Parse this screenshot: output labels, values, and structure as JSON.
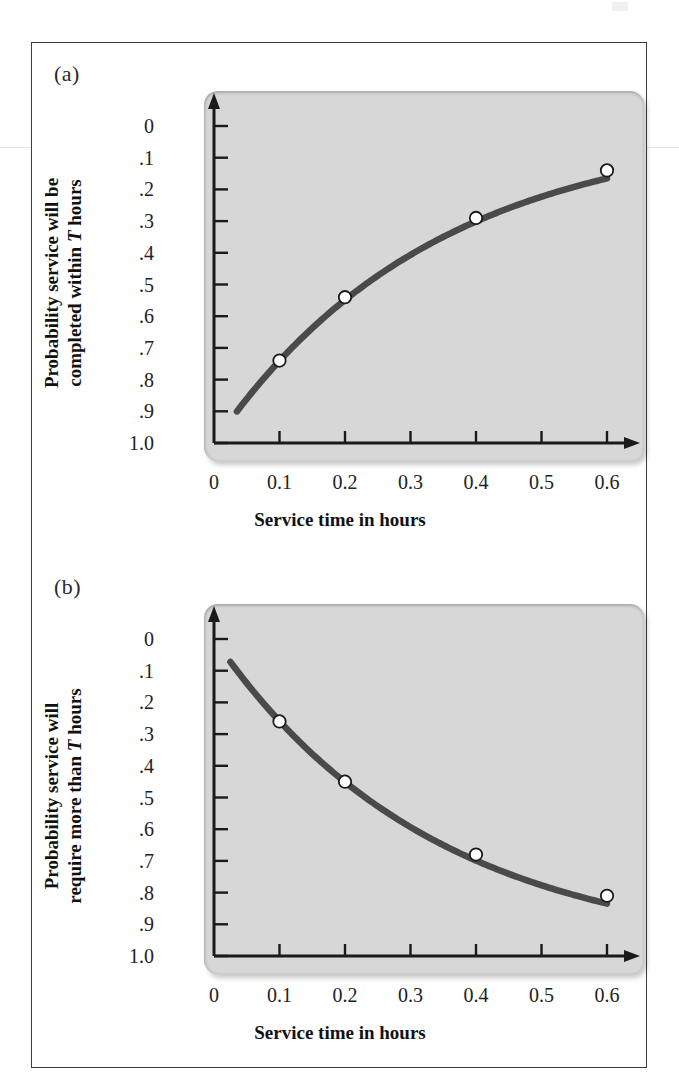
{
  "figure": {
    "panels": [
      {
        "tag": "(a)",
        "ylabel_line1": "Probability service will be",
        "ylabel_line2_pre": "completed within ",
        "ylabel_line2_ital": "T",
        "ylabel_line2_post": " hours",
        "xlabel": "Service time in hours",
        "ytick_labels": [
          "1.0",
          ".9",
          ".8",
          ".7",
          ".6",
          ".5",
          ".4",
          ".3",
          ".2",
          ".1",
          "0"
        ],
        "xtick_labels": [
          "0",
          "0.1",
          "0.2",
          "0.3",
          "0.4",
          "0.5",
          "0.6"
        ]
      },
      {
        "tag": "(b)",
        "ylabel_line1": "Probability service will",
        "ylabel_line2_pre": "require more than ",
        "ylabel_line2_ital": "T",
        "ylabel_line2_post": " hours",
        "xlabel": "Service time in hours",
        "ytick_labels": [
          "1.0",
          ".9",
          ".8",
          ".7",
          ".6",
          ".5",
          ".4",
          ".3",
          ".2",
          ".1",
          "0"
        ],
        "xtick_labels": [
          "0",
          "0.1",
          "0.2",
          "0.3",
          "0.4",
          "0.5",
          "0.6"
        ]
      }
    ],
    "colors": {
      "panel_fill": "#d7d7d7",
      "curve": "#4a4a4a",
      "axis": "#1a1a1a",
      "marker_fill": "#ffffff",
      "marker_stroke": "#1a1a1a",
      "frame": "#3c3c3c"
    }
  },
  "chart_data": [
    {
      "type": "line",
      "title": "(a)",
      "xlabel": "Service time in hours",
      "ylabel": "Probability service will be completed within T hours",
      "xlim": [
        0,
        0.65
      ],
      "ylim": [
        0,
        1.0
      ],
      "xticks": [
        0,
        0.1,
        0.2,
        0.3,
        0.4,
        0.5,
        0.6
      ],
      "xtick_labels": [
        "0",
        "0.1",
        "0.2",
        "0.3",
        "0.4",
        "0.5",
        "0.6"
      ],
      "yticks": [
        0,
        0.1,
        0.2,
        0.3,
        0.4,
        0.5,
        0.6,
        0.7,
        0.8,
        0.9,
        1.0
      ],
      "ytick_labels": [
        "0",
        ".1",
        ".2",
        ".3",
        ".4",
        ".5",
        ".6",
        ".7",
        ".8",
        ".9",
        "1.0"
      ],
      "grid": false,
      "legend": "none",
      "curve_formula": "1 - exp(-3*T)",
      "curve_x_start": 0.035,
      "curve_x_end": 0.6,
      "marked_points": {
        "x": [
          0.1,
          0.2,
          0.4,
          0.6
        ],
        "y": [
          0.26,
          0.46,
          0.71,
          0.86
        ]
      },
      "marker_style": "open-circle"
    },
    {
      "type": "line",
      "title": "(b)",
      "xlabel": "Service time in hours",
      "ylabel": "Probability service will require more than T hours",
      "xlim": [
        0,
        0.65
      ],
      "ylim": [
        0,
        1.0
      ],
      "xticks": [
        0,
        0.1,
        0.2,
        0.3,
        0.4,
        0.5,
        0.6
      ],
      "xtick_labels": [
        "0",
        "0.1",
        "0.2",
        "0.3",
        "0.4",
        "0.5",
        "0.6"
      ],
      "yticks": [
        0,
        0.1,
        0.2,
        0.3,
        0.4,
        0.5,
        0.6,
        0.7,
        0.8,
        0.9,
        1.0
      ],
      "ytick_labels": [
        "0",
        ".1",
        ".2",
        ".3",
        ".4",
        ".5",
        ".6",
        ".7",
        ".8",
        ".9",
        "1.0"
      ],
      "grid": false,
      "legend": "none",
      "curve_formula": "exp(-3*T)",
      "curve_x_start": 0.025,
      "curve_x_end": 0.6,
      "marked_points": {
        "x": [
          0.1,
          0.2,
          0.4,
          0.6
        ],
        "y": [
          0.74,
          0.55,
          0.32,
          0.19
        ]
      },
      "marker_style": "open-circle"
    }
  ]
}
